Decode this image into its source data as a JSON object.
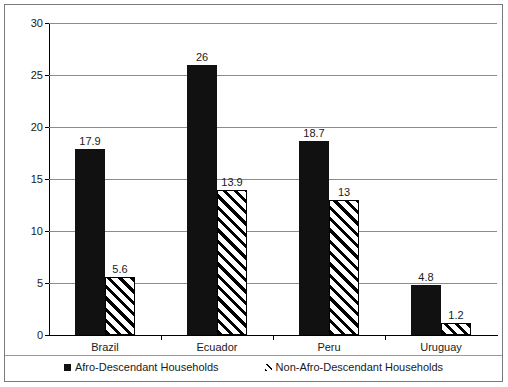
{
  "chart_data": {
    "type": "bar",
    "title": "",
    "subtitle": "",
    "xlabel": "",
    "ylabel": "",
    "ylim": [
      0,
      30
    ],
    "yticks": [
      0,
      5,
      10,
      15,
      20,
      25,
      30
    ],
    "ytick_labels": [
      "0",
      "5",
      "10",
      "15",
      "20",
      "25",
      "30"
    ],
    "grid": true,
    "legend_position": "bottom",
    "categories": [
      "Brazil",
      "Ecuador",
      "Peru",
      "Uruguay"
    ],
    "series": [
      {
        "name": "Afro-Descendant Households",
        "style": "solid-black",
        "color": "#111111",
        "values": [
          17.9,
          26,
          18.7,
          4.8
        ],
        "value_labels": [
          "17.9",
          "26",
          "18.7",
          "4.8"
        ]
      },
      {
        "name": "Non-Afro-Descendant Households",
        "style": "diagonal-hatch",
        "color": "#ffffff",
        "values": [
          5.6,
          13.9,
          13,
          1.2
        ],
        "value_labels": [
          "5.6",
          "13.9",
          "13",
          "1.2"
        ]
      }
    ]
  },
  "legend": {
    "items": [
      {
        "label": "Afro-Descendant Households",
        "marker": "solid-square-marker"
      },
      {
        "label": "Non-Afro-Descendant Households",
        "marker": "hatched-square-marker"
      }
    ]
  }
}
